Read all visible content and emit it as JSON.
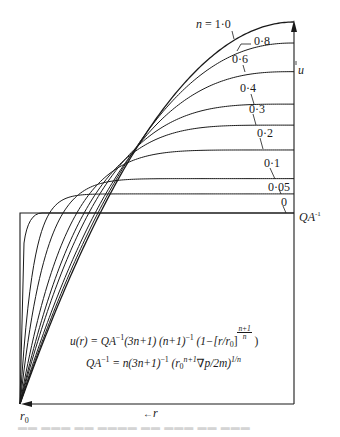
{
  "chart_data": {
    "type": "line",
    "xlabel": "r (measured inward from wall r0)",
    "ylabel": "u",
    "x_axis_label": "←r",
    "origin_label": "r0",
    "reference_line_label": "QA⁻¹",
    "legend_parameter": "n",
    "series": [
      {
        "name": "n = 1·0",
        "n": 1.0,
        "plateau_rel": 2.0
      },
      {
        "name": "0·8",
        "n": 0.8,
        "plateau_rel": 1.89
      },
      {
        "name": "0·6",
        "n": 0.6,
        "plateau_rel": 1.74
      },
      {
        "name": "0·4",
        "n": 0.4,
        "plateau_rel": 1.57
      },
      {
        "name": "0·3",
        "n": 0.3,
        "plateau_rel": 1.46
      },
      {
        "name": "0·2",
        "n": 0.2,
        "plateau_rel": 1.33
      },
      {
        "name": "0·1",
        "n": 0.1,
        "plateau_rel": 1.18
      },
      {
        "name": "0·05",
        "n": 0.05,
        "plateau_rel": 1.1
      },
      {
        "name": "0",
        "n": 0.0,
        "plateau_rel": 1.0
      }
    ],
    "equations": [
      "u(r) = QA⁻¹(3n+1) (n+1)⁻¹ (1−[r/r0]^((n+1)/n))",
      "QA⁻¹ = n(3n+1)⁻¹ (r0^(n+1) ∇p/2m)^(1/n)"
    ],
    "grid": false
  },
  "figure": {
    "curve_labels": {
      "n10": "n = 1·0",
      "n08": "0·8",
      "n06": "0·6",
      "n04": "0·4",
      "n03": "0·3",
      "n02": "0·2",
      "n01": "0·1",
      "n005": "0·05",
      "n0": "0"
    },
    "axis": {
      "u_label": "u",
      "r_label": "r",
      "r_arrow": "←",
      "origin_r": "r",
      "origin_sub": "0",
      "ref_QA": "QA",
      "ref_sup": "-1"
    },
    "eq1": {
      "lhs": "u(r) = QA",
      "sup1": "−1",
      "mid": "(3n+1) (n+1)",
      "sup2": "−1",
      "tail": " (1−[r/r",
      "sub0": "0",
      "close": "]",
      "frac_num": "n+1",
      "frac_den": "n",
      "end": " )"
    },
    "eq2": {
      "lhs": "QA",
      "sup1": "−1",
      "mid": " = n(3n+1)",
      "sup2": "−1",
      "open": " (r",
      "sub0": "0",
      "sup3": "n+1",
      "tail": "∇p/2m)",
      "sup4": "1/n"
    },
    "line_color": "#1a1a1a"
  }
}
